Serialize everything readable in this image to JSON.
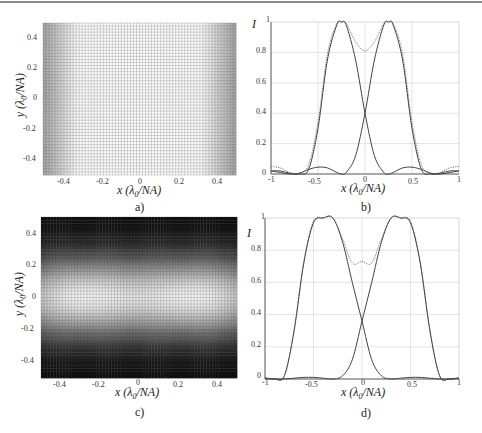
{
  "figure": {
    "panels": [
      {
        "id": "a",
        "caption": "a)",
        "type": "heatmap",
        "xlabel": "x (λ0/NA)",
        "ylabel": "y (λ0/NA)",
        "xticks": [
          "-0.4",
          "-0.2",
          "0",
          "0.2",
          "0.4"
        ],
        "yticks": [
          "0.4",
          "0.2",
          "0",
          "-0.2",
          "-0.4"
        ]
      },
      {
        "id": "b",
        "caption": "b)",
        "type": "line",
        "xlabel": "x (λ0/NA)",
        "ylabel": "I",
        "xticks": [
          "-1",
          "-0.5",
          "0",
          "0.5",
          "1"
        ],
        "yticks": [
          "1",
          "0.8",
          "0.6",
          "0.4",
          "0.2",
          "0"
        ]
      },
      {
        "id": "c",
        "caption": "c)",
        "type": "heatmap",
        "xlabel": "x (λ0/NA)",
        "ylabel": "y (λ0/NA)",
        "xticks": [
          "-0.4",
          "-0.2",
          "0",
          "0.2",
          "0.4"
        ],
        "yticks": [
          "0.4",
          "0.2",
          "0",
          "-0.2",
          "-0.4"
        ]
      },
      {
        "id": "d",
        "caption": "d)",
        "type": "line",
        "xlabel": "x (λ0/NA)",
        "ylabel": "I",
        "xticks": [
          "-1",
          "-0.5",
          "0",
          "0.5",
          "1"
        ],
        "yticks": [
          "1",
          "0.8",
          "0.6",
          "0.4",
          "0.2",
          "0"
        ]
      }
    ]
  },
  "chart_data": [
    {
      "panel": "a",
      "type": "heatmap",
      "title": "",
      "xlabel": "x (λ0/NA)",
      "ylabel": "y (λ0/NA)",
      "xlim": [
        -0.5,
        0.5
      ],
      "ylim": [
        -0.5,
        0.5
      ],
      "description": "Intensity uniform along y; bright band across |x|<~0.3, dark at x=±0.5 edges; fine mesh grid overlay",
      "x_profile_samples": {
        "x": [
          -0.5,
          -0.4,
          -0.3,
          -0.2,
          -0.1,
          0,
          0.1,
          0.2,
          0.3,
          0.4,
          0.5
        ],
        "intensity": [
          0.05,
          0.35,
          0.75,
          0.97,
          0.95,
          0.85,
          0.95,
          0.97,
          0.75,
          0.35,
          0.05
        ]
      }
    },
    {
      "panel": "b",
      "type": "line",
      "title": "",
      "xlabel": "x (λ0/NA)",
      "ylabel": "I",
      "xlim": [
        -1,
        1
      ],
      "ylim": [
        0,
        1
      ],
      "grid": true,
      "series": [
        {
          "name": "left source",
          "style": "solid",
          "peak_x": -0.25,
          "peak": 1.0
        },
        {
          "name": "right source",
          "style": "solid",
          "peak_x": 0.25,
          "peak": 1.0
        },
        {
          "name": "sum",
          "style": "dotted",
          "center_value": 0.81,
          "edge_value": 0.05
        }
      ],
      "x": [
        -1,
        -0.9,
        -0.8,
        -0.7,
        -0.6,
        -0.5,
        -0.4,
        -0.3,
        -0.25,
        -0.2,
        -0.1,
        0,
        0.1,
        0.2,
        0.25,
        0.3,
        0.4,
        0.5,
        0.6,
        0.7,
        0.8,
        0.9,
        1
      ],
      "left": [
        0.02,
        0.02,
        0.005,
        0,
        0.03,
        0.3,
        0.75,
        0.98,
        1.0,
        0.98,
        0.75,
        0.4,
        0.12,
        0.01,
        0,
        0.01,
        0.04,
        0.045,
        0.03,
        0.005,
        0.0,
        0.01,
        0.02
      ],
      "right": [
        0.02,
        0.01,
        0.0,
        0.005,
        0.03,
        0.045,
        0.04,
        0.01,
        0,
        0.01,
        0.12,
        0.4,
        0.75,
        0.98,
        1.0,
        0.98,
        0.75,
        0.3,
        0.03,
        0,
        0.005,
        0.02,
        0.02
      ],
      "sum": [
        0.05,
        0.04,
        0.01,
        0.005,
        0.06,
        0.34,
        0.79,
        0.99,
        1.0,
        0.99,
        0.87,
        0.81,
        0.87,
        0.99,
        1.0,
        0.99,
        0.79,
        0.34,
        0.06,
        0.005,
        0.01,
        0.04,
        0.05
      ]
    },
    {
      "panel": "c",
      "type": "heatmap",
      "title": "",
      "xlabel": "x (λ0/NA)",
      "ylabel": "y (λ0/NA)",
      "xlim": [
        -0.5,
        0.5
      ],
      "ylim": [
        -0.5,
        0.5
      ],
      "description": "Two bright lobes near (±0.3, 0), dark above y=0.4 and below y=-0.4; fine mesh grid overlay"
    },
    {
      "panel": "d",
      "type": "line",
      "title": "",
      "xlabel": "x (λ0/NA)",
      "ylabel": "I",
      "xlim": [
        -1,
        1
      ],
      "ylim": [
        0,
        1
      ],
      "grid": true,
      "series": [
        {
          "name": "left source",
          "style": "solid",
          "peak_x": -0.3,
          "peak": 1.0
        },
        {
          "name": "right source",
          "style": "solid",
          "peak_x": 0.3,
          "peak": 1.0
        },
        {
          "name": "sum",
          "style": "dotted",
          "center_value": 0.73,
          "edge_value": 0.01
        }
      ],
      "x": [
        -1,
        -0.9,
        -0.8,
        -0.7,
        -0.6,
        -0.5,
        -0.4,
        -0.3,
        -0.2,
        -0.1,
        0,
        0.1,
        0.2,
        0.3,
        0.4,
        0.5,
        0.6,
        0.7,
        0.8,
        0.9,
        1
      ],
      "left": [
        0.005,
        0.0,
        0.02,
        0.3,
        0.72,
        0.97,
        1.0,
        1.0,
        0.85,
        0.6,
        0.36,
        0.12,
        0.02,
        0,
        0.005,
        0.01,
        0.01,
        0.005,
        0,
        0.0,
        0.005
      ],
      "right": [
        0.005,
        0.0,
        0,
        0.005,
        0.01,
        0.01,
        0.005,
        0,
        0.02,
        0.12,
        0.36,
        0.6,
        0.85,
        1.0,
        1.0,
        0.97,
        0.72,
        0.3,
        0.02,
        0.0,
        0.005
      ],
      "sum": [
        0.01,
        0.0,
        0.02,
        0.305,
        0.73,
        0.98,
        1.0,
        1.0,
        0.87,
        0.72,
        0.73,
        0.72,
        0.87,
        1.0,
        1.0,
        0.98,
        0.73,
        0.305,
        0.02,
        0.0,
        0.01
      ]
    }
  ]
}
